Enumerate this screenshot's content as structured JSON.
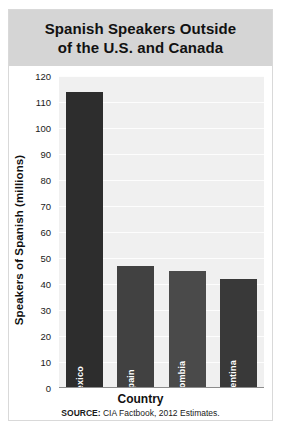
{
  "chart_data": {
    "type": "bar",
    "title": "Spanish Speakers Outside\nof the U.S. and Canada",
    "categories": [
      "Mexico",
      "Spain",
      "Colombia",
      "Argentina"
    ],
    "values": [
      114,
      47,
      45,
      42
    ],
    "xlabel": "Country",
    "ylabel": "Speakers of Spanish (millions)",
    "ylim": [
      0,
      120
    ],
    "ytick_step": 10,
    "yticks": [
      0,
      10,
      20,
      30,
      40,
      50,
      60,
      70,
      80,
      90,
      100,
      110,
      120
    ],
    "grid": true,
    "legend": false,
    "bar_colors": [
      "#2d2d2d",
      "#414141",
      "#4a4a4a",
      "#393939"
    ],
    "plot_background": "#f0f0f0",
    "title_band_color": "#d5d5d5",
    "label_color": "#ffffff"
  },
  "source": {
    "prefix": "SOURCE:",
    "text": "CIA Factbook, 2012 Estimates."
  }
}
